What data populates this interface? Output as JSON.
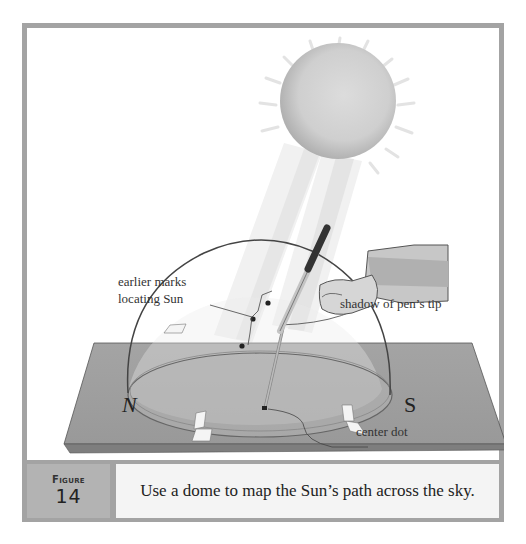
{
  "figure": {
    "label_word": "Figure",
    "number": "14",
    "caption": "Use a dome to map the Sun’s path across the sky."
  },
  "labels": {
    "earlier_marks_line1": "earlier marks",
    "earlier_marks_line2": "locating Sun",
    "shadow": "shadow of pen’s tip",
    "center_dot": "center dot",
    "north": "N",
    "south": "S"
  },
  "colors": {
    "frame": "#a3a3a3",
    "board": "#9c9c9c",
    "sun": "#c8c8c8",
    "caption_bg": "#f4f4f4"
  }
}
